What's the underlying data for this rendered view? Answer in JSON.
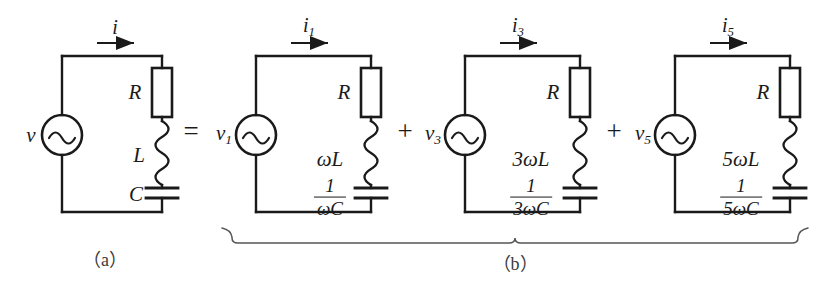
{
  "figure": {
    "type": "circuit-diagram",
    "caption_a": "（a）",
    "caption_b": "（b）",
    "operators": {
      "equals": "=",
      "plus_1": "+",
      "plus_2": "+"
    },
    "colors": {
      "wire": "#1a1a1a",
      "background": "#ffffff",
      "brace": "#555555",
      "caption": "#3a3a3a"
    }
  },
  "circuits": [
    {
      "id": "circuit-a",
      "source_label": "v",
      "source_sub": "",
      "current_label": "i",
      "current_sub": "",
      "resistor_label": "R",
      "inductor_label": "L",
      "inductor_prefix": "",
      "capacitor_label": "C",
      "capacitor_is_fraction": false,
      "capacitor_num": "",
      "capacitor_den": ""
    },
    {
      "id": "circuit-b1",
      "source_label": "v",
      "source_sub": "1",
      "current_label": "i",
      "current_sub": "1",
      "resistor_label": "R",
      "inductor_label": "L",
      "inductor_prefix": "ω",
      "capacitor_label": "",
      "capacitor_is_fraction": true,
      "capacitor_num": "1",
      "capacitor_den": "ωC"
    },
    {
      "id": "circuit-b3",
      "source_label": "v",
      "source_sub": "3",
      "current_label": "i",
      "current_sub": "3",
      "resistor_label": "R",
      "inductor_label": "L",
      "inductor_prefix": "3ω",
      "capacitor_label": "",
      "capacitor_is_fraction": true,
      "capacitor_num": "1",
      "capacitor_den": "3ωC"
    },
    {
      "id": "circuit-b5",
      "source_label": "v",
      "source_sub": "5",
      "current_label": "i",
      "current_sub": "5",
      "resistor_label": "R",
      "inductor_label": "L",
      "inductor_prefix": "5ω",
      "capacitor_label": "",
      "capacitor_is_fraction": true,
      "capacitor_num": "1",
      "capacitor_den": "5ωC"
    }
  ],
  "labels": {
    "c1_i": "i",
    "c1_v": "v",
    "c1_R": "R",
    "c1_L": "L",
    "c1_C": "C",
    "c2_R": "R",
    "c2_wL": "ωL",
    "c3_R": "R",
    "c3_wL": "3ωL",
    "c4_R": "R",
    "c4_wL": "5ωL"
  }
}
